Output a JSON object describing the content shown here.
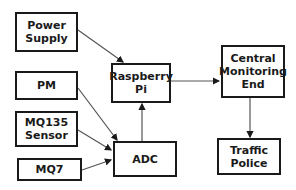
{
  "diagram": {
    "type": "block-diagram",
    "nodes": [
      {
        "id": "power_supply",
        "label": "Power\nSupply"
      },
      {
        "id": "pm",
        "label": "PM"
      },
      {
        "id": "mq135",
        "label": "MQ135\nSensor"
      },
      {
        "id": "mq7",
        "label": "MQ7"
      },
      {
        "id": "raspberry_pi",
        "label": "Raspberry\nPi"
      },
      {
        "id": "adc",
        "label": "ADC"
      },
      {
        "id": "central",
        "label": "Central\nMonitoring\nEnd"
      },
      {
        "id": "traffic_police",
        "label": "Traffic\nPolice"
      }
    ],
    "edges": [
      {
        "from": "power_supply",
        "to": "raspberry_pi"
      },
      {
        "from": "pm",
        "to": "adc"
      },
      {
        "from": "mq135",
        "to": "adc"
      },
      {
        "from": "mq7",
        "to": "adc"
      },
      {
        "from": "adc",
        "to": "raspberry_pi"
      },
      {
        "from": "raspberry_pi",
        "to": "central"
      },
      {
        "from": "central",
        "to": "traffic_police"
      }
    ],
    "colors": {
      "stroke": "#1a1a1a",
      "arrow": "#555555",
      "background": "#ffffff"
    }
  }
}
